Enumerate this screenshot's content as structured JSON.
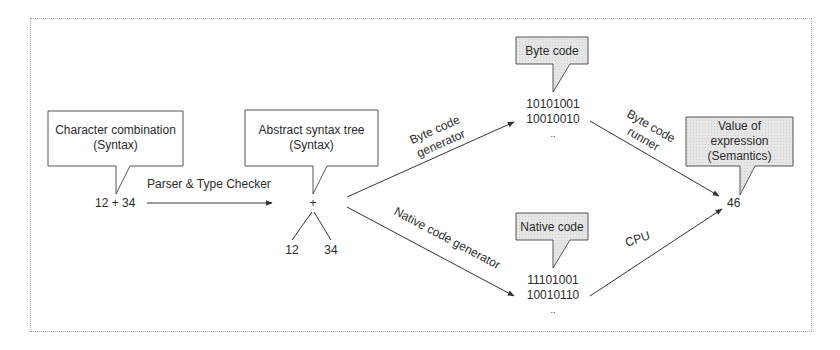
{
  "diagram": {
    "title": "",
    "nodes": {
      "source": {
        "callout_line1": "Character combination",
        "callout_line2": "(Syntax)",
        "value": "12 + 34"
      },
      "ast": {
        "callout_line1": "Abstract syntax tree",
        "callout_line2": "(Syntax)",
        "root": "+",
        "left_child": "12",
        "right_child": "34"
      },
      "bytecode": {
        "callout": "Byte code",
        "line1": "10101001",
        "line2": "10010010",
        "ellipsis": ".."
      },
      "nativecode": {
        "callout": "Native code",
        "line1": "11101001",
        "line2": "10010110",
        "ellipsis": ".."
      },
      "result": {
        "callout_line1": "Value of",
        "callout_line2": "expression",
        "callout_line3": "(Semantics)",
        "value": "46"
      }
    },
    "edges": {
      "parser": "Parser & Type Checker",
      "bytecode_gen_line1": "Byte code",
      "bytecode_gen_line2": "generator",
      "native_gen": "Native code generator",
      "bytecode_runner_line1": "Byte code",
      "bytecode_runner_line2": "runner",
      "cpu": "CPU"
    },
    "colors": {
      "line": "#333333",
      "plain_callout_fill": "#ffffff",
      "shaded_callout_fill": "#e4e4e4",
      "frame_border": "#a8a8a8"
    }
  }
}
